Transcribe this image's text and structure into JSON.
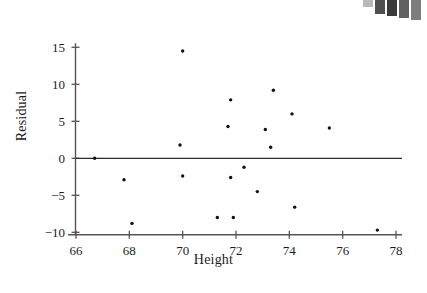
{
  "figure": {
    "background": "#ffffff",
    "ink": "#1c1c1c",
    "point_color": "#111111",
    "axis_color": "#555555"
  },
  "swatches": {
    "name": "grayscale-calibration-strip",
    "colors": [
      "#b9b9b9",
      "#4f4f4f",
      "#3a3a3a",
      "#606060",
      "#7d7d7d"
    ],
    "heights": [
      7,
      14,
      16,
      18,
      20
    ]
  },
  "chart_data": {
    "type": "scatter",
    "title": "",
    "xlabel": "Height",
    "ylabel": "Residual",
    "xlim": [
      66,
      78
    ],
    "ylim": [
      -10,
      15
    ],
    "xticks": [
      66,
      68,
      70,
      72,
      74,
      76,
      78
    ],
    "yticks": [
      15,
      10,
      5,
      0,
      -5,
      -10
    ],
    "xtick_labels": [
      "66",
      "68",
      "70",
      "72",
      "74",
      "76",
      "78"
    ],
    "ytick_labels": [
      "15",
      "10",
      "5",
      "0",
      "−5",
      "−10"
    ],
    "grid": false,
    "legend": null,
    "reference_line": {
      "orientation": "horizontal",
      "y": 0
    },
    "marker": {
      "shape": "circle",
      "size_px": 3.4,
      "color": "#111111"
    },
    "points": [
      {
        "x": 66.7,
        "y": 0.0
      },
      {
        "x": 67.8,
        "y": -2.9
      },
      {
        "x": 68.1,
        "y": -8.8
      },
      {
        "x": 69.9,
        "y": 1.8
      },
      {
        "x": 70.0,
        "y": 14.5
      },
      {
        "x": 70.0,
        "y": -2.4
      },
      {
        "x": 71.3,
        "y": -8.0
      },
      {
        "x": 71.7,
        "y": 4.3
      },
      {
        "x": 71.8,
        "y": 7.9
      },
      {
        "x": 71.8,
        "y": -2.6
      },
      {
        "x": 71.9,
        "y": -8.0
      },
      {
        "x": 72.3,
        "y": -1.2
      },
      {
        "x": 72.8,
        "y": -4.5
      },
      {
        "x": 73.1,
        "y": 3.9
      },
      {
        "x": 73.3,
        "y": 1.5
      },
      {
        "x": 73.4,
        "y": 9.2
      },
      {
        "x": 74.1,
        "y": 6.0
      },
      {
        "x": 74.2,
        "y": -6.6
      },
      {
        "x": 75.5,
        "y": 4.1
      },
      {
        "x": 77.3,
        "y": -9.7
      }
    ]
  }
}
